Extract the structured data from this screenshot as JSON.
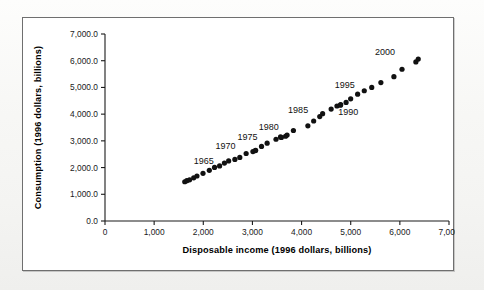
{
  "figure": {
    "background_color": "#ffffff",
    "frame_color": "#6f6f6f",
    "marker_color": "#111111"
  },
  "chart_data": {
    "type": "scatter",
    "title": "",
    "xlabel": "Disposable income (1996 dollars, billions)",
    "ylabel": "Consumption (1996 dollars, billions)",
    "xlim": [
      0,
      7000
    ],
    "ylim": [
      0,
      7000
    ],
    "xticks": [
      0,
      1000,
      2000,
      3000,
      4000,
      5000,
      6000,
      7000
    ],
    "yticks": [
      0,
      1000,
      2000,
      3000,
      4000,
      5000,
      6000,
      7000
    ],
    "xtick_labels": [
      "0",
      "1,000",
      "2,000",
      "3,000",
      "4,000",
      "5,000",
      "6,000",
      "7,000"
    ],
    "ytick_labels": [
      "0.0",
      "1,000.0",
      "2,000.0",
      "3,000.0",
      "4,000.0",
      "5,000.0",
      "6,000.0",
      "7,000.0"
    ],
    "grid": false,
    "legend": false,
    "series": [
      {
        "name": "Consumption vs disposable income",
        "points": [
          {
            "year": 1959,
            "x": 1623,
            "y": 1470
          },
          {
            "year": 1960,
            "x": 1665,
            "y": 1510
          },
          {
            "year": 1961,
            "x": 1721,
            "y": 1541
          },
          {
            "year": 1962,
            "x": 1805,
            "y": 1617
          },
          {
            "year": 1963,
            "x": 1871,
            "y": 1684
          },
          {
            "year": 1964,
            "x": 1994,
            "y": 1785
          },
          {
            "year": 1965,
            "x": 2123,
            "y": 1898
          },
          {
            "year": 1966,
            "x": 2229,
            "y": 2005
          },
          {
            "year": 1967,
            "x": 2332,
            "y": 2061
          },
          {
            "year": 1968,
            "x": 2430,
            "y": 2168
          },
          {
            "year": 1969,
            "x": 2516,
            "y": 2249
          },
          {
            "year": 1970,
            "x": 2643,
            "y": 2305
          },
          {
            "year": 1971,
            "x": 2743,
            "y": 2379
          },
          {
            "year": 1972,
            "x": 2872,
            "y": 2526
          },
          {
            "year": 1973,
            "x": 3061,
            "y": 2636
          },
          {
            "year": 1974,
            "x": 3010,
            "y": 2599
          },
          {
            "year": 1975,
            "x": 3065,
            "y": 2648
          },
          {
            "year": 1976,
            "x": 3185,
            "y": 2792
          },
          {
            "year": 1977,
            "x": 3299,
            "y": 2915
          },
          {
            "year": 1978,
            "x": 3480,
            "y": 3060
          },
          {
            "year": 1979,
            "x": 3572,
            "y": 3148
          },
          {
            "year": 1980,
            "x": 3589,
            "y": 3126
          },
          {
            "year": 1981,
            "x": 3674,
            "y": 3173
          },
          {
            "year": 1982,
            "x": 3705,
            "y": 3216
          },
          {
            "year": 1983,
            "x": 3834,
            "y": 3387
          },
          {
            "year": 1984,
            "x": 4128,
            "y": 3562
          },
          {
            "year": 1985,
            "x": 4246,
            "y": 3743
          },
          {
            "year": 1986,
            "x": 4370,
            "y": 3908
          },
          {
            "year": 1987,
            "x": 4428,
            "y": 4019
          },
          {
            "year": 1988,
            "x": 4602,
            "y": 4190
          },
          {
            "year": 1989,
            "x": 4720,
            "y": 4304
          },
          {
            "year": 1990,
            "x": 4796,
            "y": 4358
          },
          {
            "year": 1991,
            "x": 4791,
            "y": 4337
          },
          {
            "year": 1992,
            "x": 4906,
            "y": 4440
          },
          {
            "year": 1993,
            "x": 4999,
            "y": 4575
          },
          {
            "year": 1994,
            "x": 5141,
            "y": 4748
          },
          {
            "year": 1995,
            "x": 5276,
            "y": 4875
          },
          {
            "year": 1996,
            "x": 5428,
            "y": 5001
          },
          {
            "year": 1997,
            "x": 5614,
            "y": 5180
          },
          {
            "year": 1998,
            "x": 5879,
            "y": 5401
          },
          {
            "year": 1999,
            "x": 6044,
            "y": 5681
          },
          {
            "year": 2000,
            "x": 6326,
            "y": 5956
          },
          {
            "year": 2001,
            "x": 6374,
            "y": 6063
          }
        ]
      }
    ],
    "annotations": [
      {
        "text": "1965",
        "data_x": 2010,
        "data_y": 2150
      },
      {
        "text": "1970",
        "data_x": 2450,
        "data_y": 2680
      },
      {
        "text": "1975",
        "data_x": 2900,
        "data_y": 3020
      },
      {
        "text": "1980",
        "data_x": 3330,
        "data_y": 3410
      },
      {
        "text": "1985",
        "data_x": 3930,
        "data_y": 4060
      },
      {
        "text": "1990",
        "data_x": 4950,
        "data_y": 3980
      },
      {
        "text": "1995",
        "data_x": 4880,
        "data_y": 4960
      },
      {
        "text": "2000",
        "data_x": 5700,
        "data_y": 6210
      }
    ]
  }
}
